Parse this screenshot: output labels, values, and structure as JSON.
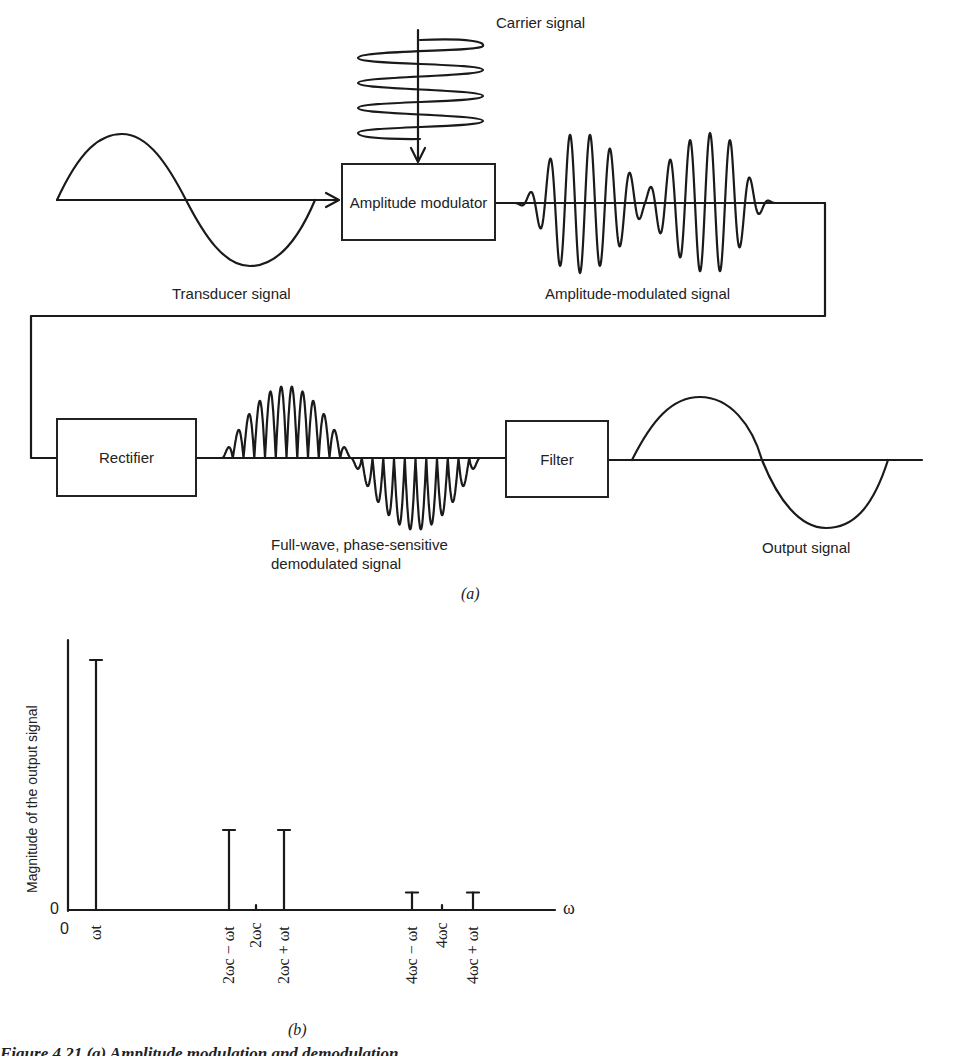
{
  "diagram_a": {
    "label": "(a)",
    "blocks": {
      "modulator": "Amplitude modulator",
      "rectifier": "Rectifier",
      "filter": "Filter"
    },
    "signals": {
      "carrier": "Carrier signal",
      "transducer": "Transducer signal",
      "am": "Amplitude-modulated signal",
      "demod_line1": "Full-wave, phase-sensitive",
      "demod_line2": "demodulated signal",
      "output": "Output signal"
    }
  },
  "chart_data": {
    "type": "bar",
    "title": "",
    "label": "(b)",
    "xlabel": "ω",
    "ylabel": "Magnitude of the output signal",
    "origin_x_label": "0",
    "origin_y_label": "0",
    "categories": [
      "ωt",
      "2ωc − ωt",
      "2ωc",
      "2ωc + ωt",
      "4ωc − ωt",
      "4ωc",
      "4ωc + ωt"
    ],
    "values": [
      1.0,
      0.32,
      0.02,
      0.32,
      0.07,
      0.02,
      0.07
    ],
    "grid": false
  },
  "caption": "Figure 4.21   (a) Amplitude modulation and demodulation"
}
